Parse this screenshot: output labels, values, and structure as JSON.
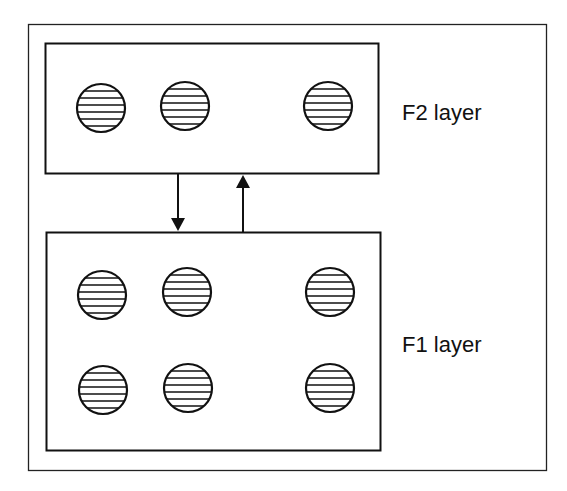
{
  "diagram": {
    "type": "neural-network-layers",
    "layers": [
      {
        "id": "f2",
        "label": "F2 layer",
        "node_count": 3,
        "rows": 1
      },
      {
        "id": "f1",
        "label": "F1 layer",
        "node_count": 6,
        "rows": 2
      }
    ],
    "connections": [
      {
        "from": "f2",
        "to": "f1",
        "direction": "down"
      },
      {
        "from": "f1",
        "to": "f2",
        "direction": "up"
      }
    ],
    "colors": {
      "stroke": "#111111",
      "background": "#ffffff"
    }
  }
}
